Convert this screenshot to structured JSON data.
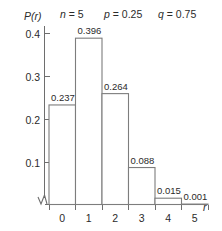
{
  "chart_data": {
    "type": "bar",
    "title": "",
    "subtitle": "",
    "xlabel": "r",
    "ylabel": "P(r)",
    "categories": [
      "0",
      "1",
      "2",
      "3",
      "4",
      "5"
    ],
    "values": [
      0.237,
      0.396,
      0.264,
      0.088,
      0.015,
      0.001
    ],
    "value_labels": [
      "0.237",
      "0.396",
      "0.264",
      "0.088",
      "0.015",
      "0.001"
    ],
    "ylim": [
      0,
      0.42
    ],
    "xlim": [
      -0.5,
      5.5
    ],
    "ytick_labels": [
      "0.1",
      "0.2",
      "0.3",
      "0.4"
    ],
    "ytick_values": [
      0.1,
      0.2,
      0.3,
      0.4
    ],
    "xtick_labels": [
      "0",
      "1",
      "2",
      "3",
      "4",
      "5"
    ],
    "grid": false,
    "legend": "none",
    "axis_break": true,
    "annotations": [
      {
        "id": "n",
        "var": "n",
        "eq": " = 5"
      },
      {
        "id": "p",
        "var": "p",
        "eq": " = 0.25"
      },
      {
        "id": "q",
        "var": "q",
        "eq": " = 0.75"
      }
    ],
    "colors": {
      "bar_fill": "#ffffff",
      "bar_stroke": "#7d7d7d",
      "axis": "#6e6e6e",
      "text": "#2b2b2b",
      "background": "#ffffff"
    }
  }
}
